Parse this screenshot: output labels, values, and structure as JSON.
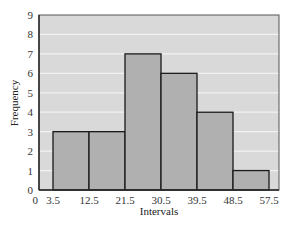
{
  "chart_data": {
    "type": "bar",
    "subtype": "histogram",
    "title": "",
    "xlabel": "Intervals",
    "ylabel": "Frequency",
    "bin_edges": [
      3.5,
      12.5,
      21.5,
      30.5,
      39.5,
      48.5,
      57.5
    ],
    "categories": [
      "3.5–12.5",
      "12.5–21.5",
      "21.5–30.5",
      "30.5–39.5",
      "39.5–48.5",
      "48.5–57.5"
    ],
    "values": [
      3,
      3,
      7,
      6,
      4,
      1
    ],
    "x_tick_labels": [
      "0",
      "3.5",
      "12.5",
      "21.5",
      "30.5",
      "39.5",
      "48.5",
      "57.5"
    ],
    "y_tick_labels": [
      "0",
      "1",
      "2",
      "3",
      "4",
      "5",
      "6",
      "7",
      "8",
      "9"
    ],
    "ylim": [
      0,
      9
    ],
    "xlim": [
      0,
      60
    ],
    "grid": true,
    "legend": "none",
    "colors": {
      "plot_background": "#d9d9d9",
      "bar_fill": "#b0b0b0",
      "bar_edge": "#1a1a1a",
      "grid": "#f2f2f2"
    }
  }
}
